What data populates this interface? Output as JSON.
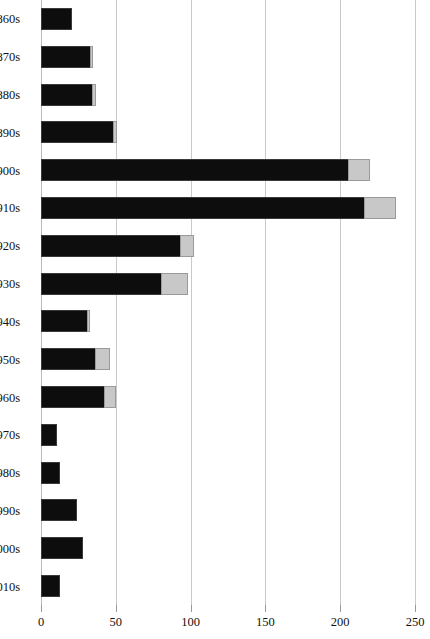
{
  "chart_data": {
    "type": "bar",
    "orientation": "horizontal",
    "stacked": true,
    "title": "",
    "subtitle": "",
    "xlabel": "",
    "ylabel": "",
    "xlim": [
      0,
      250
    ],
    "ylim": null,
    "grid": true,
    "grid_axis": "x",
    "legend": false,
    "legend_position": "none",
    "categories": [
      "1860s",
      "1870s",
      "1880s",
      "1890s",
      "1900s",
      "1910s",
      "1920s",
      "1930s",
      "1940s",
      "1950s",
      "1960s",
      "1970s",
      "1980s",
      "1990s",
      "2000s",
      "2010s"
    ],
    "xticks": [
      0,
      50,
      100,
      150,
      200,
      250
    ],
    "xtick_labels": [
      "0",
      "50",
      "100",
      "150",
      "200",
      "250"
    ],
    "series": [
      {
        "name": "primary",
        "color": "#0d0d0d",
        "values": [
          21,
          33,
          34,
          48,
          205,
          216,
          93,
          80,
          31,
          36,
          42,
          11,
          13,
          24,
          28,
          13
        ]
      },
      {
        "name": "secondary",
        "color": "#c8c8c8",
        "values": [
          0,
          2,
          3,
          3,
          15,
          21,
          9,
          18,
          2,
          10,
          8,
          0,
          0,
          0,
          0,
          0
        ]
      }
    ],
    "totals": [
      21,
      35,
      37,
      51,
      220,
      237,
      102,
      98,
      33,
      46,
      50,
      11,
      13,
      24,
      28,
      13
    ]
  },
  "colors": {
    "primary": "#0d0d0d",
    "secondary": "#c8c8c8",
    "secondary_border": "#9a9a9a",
    "gridline": "#c9c9c9",
    "background": "#ffffff",
    "text": "#111111"
  }
}
